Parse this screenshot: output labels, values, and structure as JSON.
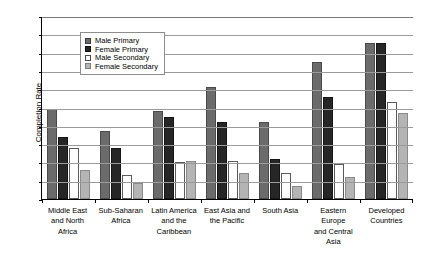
{
  "chart_data": {
    "type": "bar",
    "title": "",
    "xlabel": "",
    "ylabel": "Completion Rate",
    "ylim": [
      0,
      100
    ],
    "ytick_step": 10,
    "yticks": [
      "100",
      "90",
      "80",
      "70",
      "60",
      "50",
      "40",
      "30",
      "20",
      "10",
      "0"
    ],
    "grid": true,
    "legend_position": "top-left-inset",
    "categories": [
      "Middle East and North Africa",
      "Sub-Saharan Africa",
      "Latin America and the Caribbean",
      "East Asia and the Pacific",
      "South Asia",
      "Eastern Europe and Central Asia",
      "Developed Countries"
    ],
    "category_lines": [
      [
        "Middle East",
        "and North",
        "Africa"
      ],
      [
        "Sub-Saharan",
        "Africa"
      ],
      [
        "Latin America",
        "and the",
        "Caribbean"
      ],
      [
        "East Asia and",
        "the Pacific"
      ],
      [
        "South Asia"
      ],
      [
        "Eastern Europe",
        "and Central",
        "Asia"
      ],
      [
        "Developed",
        "Countries"
      ]
    ],
    "series": [
      {
        "name": "Male Primary",
        "color": "#6b6b6b",
        "values": [
          49,
          37,
          48,
          61,
          42,
          75,
          85
        ]
      },
      {
        "name": "Female Primary",
        "color": "#262626",
        "values": [
          34,
          28,
          45,
          42,
          22,
          56,
          85
        ]
      },
      {
        "name": "Male Secondary",
        "color": "#ffffff",
        "values": [
          28,
          13,
          20,
          21,
          14,
          19,
          53
        ]
      },
      {
        "name": "Female Secondary",
        "color": "#b4b4b4",
        "values": [
          16,
          9,
          21,
          14,
          7,
          12,
          47
        ]
      }
    ]
  }
}
